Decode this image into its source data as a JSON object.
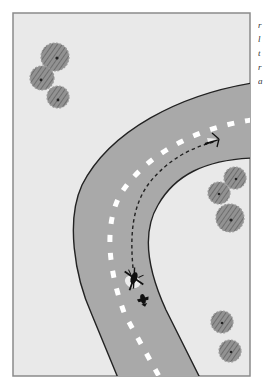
{
  "figure": {
    "colors": {
      "ground": "#e9e9e9",
      "frame_border": "#8a8a8a",
      "road": "#a9a9a9",
      "road_edge": "#222222",
      "lane_marking": "#ffffff",
      "flight_path": "#222222",
      "tree_fill": "#8c8c8c",
      "tree_dark": "#5a5a5a",
      "aircraft": "#111111"
    },
    "trees": [
      {
        "x": 55,
        "y": 57,
        "r": 14
      },
      {
        "x": 42,
        "y": 78,
        "r": 12
      },
      {
        "x": 58,
        "y": 97,
        "r": 11
      },
      {
        "x": 235,
        "y": 178,
        "r": 11
      },
      {
        "x": 219,
        "y": 193,
        "r": 11
      },
      {
        "x": 230,
        "y": 218,
        "r": 14
      },
      {
        "x": 222,
        "y": 322,
        "r": 11
      },
      {
        "x": 230,
        "y": 351,
        "r": 11
      }
    ],
    "icons": [
      "helicopter-icon",
      "aircraft-shadow-icon",
      "path-arrow-icon",
      "tree-icon"
    ],
    "clipped_side_text": [
      "r",
      "l",
      "t",
      "r",
      "a"
    ]
  }
}
